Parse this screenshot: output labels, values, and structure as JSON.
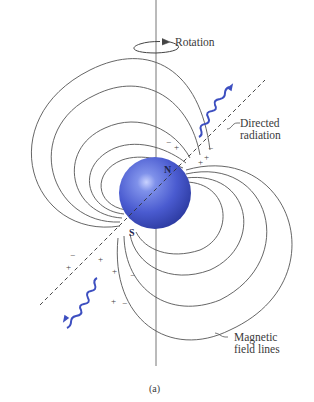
{
  "figure": {
    "caption": "(a)",
    "labels": {
      "rotation": "Rotation",
      "directed_radiation_line1": "Directed",
      "directed_radiation_line2": "radiation",
      "magnetic_field_line1": "Magnetic",
      "magnetic_field_line2": "field lines"
    },
    "poles": {
      "north": "N",
      "south": "S"
    },
    "signs": {
      "plus": "+",
      "minus": "−"
    },
    "colors": {
      "star": "#4a5fd0",
      "radiation": "#3d4fc0",
      "lines": "#555555",
      "axis": "#666666"
    }
  }
}
